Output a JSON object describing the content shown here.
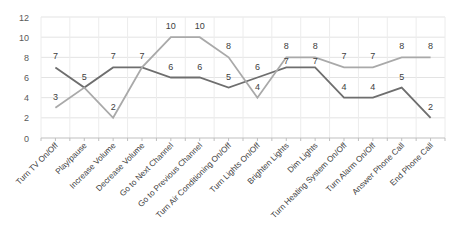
{
  "chart_data": {
    "type": "line",
    "title": "",
    "xlabel": "",
    "ylabel": "",
    "ylim": [
      0,
      12
    ],
    "yticks": [
      0,
      2,
      4,
      6,
      8,
      10,
      12
    ],
    "grid": true,
    "legend": "none",
    "categories": [
      "Turn TV On/Off",
      "Play/pause",
      "Increase Volume",
      "Decrease Volume",
      "Go to Next Channel",
      "Go to Previous Channel",
      "Turn Air Conditioning On/Off",
      "Turn Lights On/Off",
      "Brighten Lights",
      "Dim Lights",
      "Turn Heating System On/Off",
      "Turn Alarm On/Off",
      "Answer Phone Call",
      "End Phone Call"
    ],
    "series": [
      {
        "name": "Series 1",
        "color": "#6e6e6e",
        "values": [
          7,
          5,
          7,
          7,
          6,
          6,
          5,
          6,
          7,
          7,
          4,
          4,
          5,
          2
        ]
      },
      {
        "name": "Series 2",
        "color": "#a9a9a9",
        "values": [
          3,
          5,
          2,
          7,
          10,
          10,
          8,
          4,
          8,
          8,
          7,
          7,
          8,
          8
        ]
      }
    ]
  }
}
